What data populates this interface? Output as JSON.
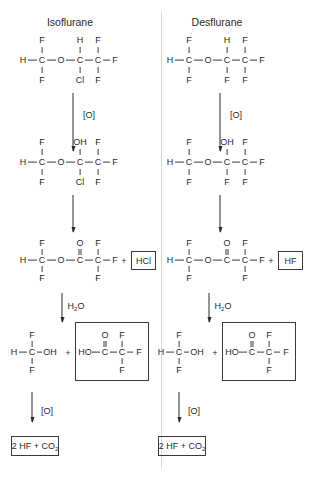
{
  "columns": [
    {
      "title": "Isoflurane",
      "step1": {
        "top": [
          "F",
          "H",
          "F"
        ],
        "main": [
          "H",
          "C",
          "O",
          "C",
          "C",
          "F"
        ],
        "bottom": [
          "F",
          "Cl",
          "F"
        ]
      },
      "arrow1_label": "[O]",
      "step2": {
        "top": [
          "F",
          "OH",
          "F"
        ],
        "main": [
          "H",
          "C",
          "O",
          "C",
          "C",
          "F"
        ],
        "bottom": [
          "F",
          "Cl",
          "F"
        ]
      },
      "step3": {
        "top": [
          "F",
          "O",
          "F"
        ],
        "main": [
          "H",
          "C",
          "O",
          "C",
          "C",
          "F"
        ],
        "bottom": [
          "F",
          "F"
        ],
        "plus": "+",
        "byproduct": "HCl"
      },
      "arrow3_label": "H",
      "arrow3_sub": "2",
      "arrow3_suffix": "O",
      "step4": {
        "left_top": "F",
        "left_main": [
          "H",
          "C",
          "OH"
        ],
        "left_bottom": "F",
        "plus": "+",
        "acid_top": [
          "O",
          "F"
        ],
        "acid_main": [
          "HO",
          "C",
          "C",
          "F"
        ],
        "acid_bottom": "F"
      },
      "arrow4_label": "[O]",
      "final": {
        "prefix": "2 HF + CO",
        "sub": "2"
      }
    },
    {
      "title": "Desflurane",
      "step1": {
        "top": [
          "F",
          "H",
          "F"
        ],
        "main": [
          "H",
          "C",
          "O",
          "C",
          "C",
          "F"
        ],
        "bottom": [
          "F",
          "F",
          "F"
        ]
      },
      "arrow1_label": "[O]",
      "step2": {
        "top": [
          "F",
          "OH",
          "F"
        ],
        "main": [
          "H",
          "C",
          "O",
          "C",
          "C",
          "F"
        ],
        "bottom": [
          "F",
          "F",
          "F"
        ]
      },
      "step3": {
        "top": [
          "F",
          "O",
          "F"
        ],
        "main": [
          "H",
          "C",
          "O",
          "C",
          "C",
          "F"
        ],
        "bottom": [
          "F",
          "F"
        ],
        "plus": "+",
        "byproduct": "HF"
      },
      "arrow3_label": "H",
      "arrow3_sub": "2",
      "arrow3_suffix": "O",
      "step4": {
        "left_top": "F",
        "left_main": [
          "H",
          "C",
          "OH"
        ],
        "left_bottom": "F",
        "plus": "+",
        "acid_top": [
          "O",
          "F"
        ],
        "acid_main": [
          "HO",
          "C",
          "C",
          "F"
        ],
        "acid_bottom": "F"
      },
      "arrow4_label": "[O]",
      "final": {
        "prefix": "2 HF + CO",
        "sub": "2"
      }
    }
  ]
}
